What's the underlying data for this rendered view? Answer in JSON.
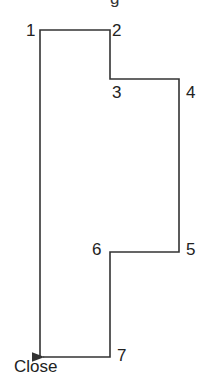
{
  "diagram": {
    "top_partial_text": "g",
    "points": [
      {
        "label": "1",
        "x": 40,
        "y": 30
      },
      {
        "label": "2",
        "x": 110,
        "y": 30
      },
      {
        "label": "3",
        "x": 110,
        "y": 79
      },
      {
        "label": "4",
        "x": 179,
        "y": 79
      },
      {
        "label": "5",
        "x": 179,
        "y": 252
      },
      {
        "label": "6",
        "x": 110,
        "y": 252
      },
      {
        "label": "7",
        "x": 110,
        "y": 357
      }
    ],
    "close_label": "Close",
    "line_color": "#333333"
  }
}
